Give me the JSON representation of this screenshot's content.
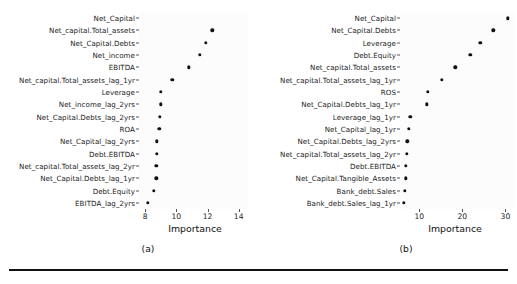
{
  "figure": {
    "caption_a": "(a)",
    "caption_b": "(b)"
  },
  "chart_data": [
    {
      "type": "scatter",
      "panel": "a",
      "title": "",
      "xlabel": "Importance",
      "ylabel": "",
      "xlim": [
        7.6,
        14.6
      ],
      "xticks": [
        8,
        10,
        12,
        14
      ],
      "xticklabels": [
        "8",
        "10",
        "12",
        "14"
      ],
      "grid": false,
      "legend": null,
      "categories": [
        "Net_Capital",
        "Net_capital.Total_assets",
        "Net_Capital.Debts",
        "Net_income",
        "EBITDA",
        "Net_capital.Total_assets_lag_1yr",
        "Leverage",
        "Net_income_lag_2yrs",
        "Net_Capital.Debts_lag_2yrs",
        "ROA",
        "Net_Capital_lag_2yrs",
        "Debt.EBITDA",
        "Net_capital.Total_assets_lag_2yr",
        "Net_Capital.Debts_lag_1yr",
        "Debt.Equity",
        "EBITDA_lag_2yrs"
      ],
      "values": [
        null,
        12.3,
        11.9,
        11.5,
        10.8,
        9.75,
        9.0,
        9.0,
        8.95,
        8.9,
        8.75,
        8.75,
        8.7,
        8.7,
        8.55,
        8.15
      ]
    },
    {
      "type": "scatter",
      "panel": "b",
      "title": "",
      "xlabel": "Importance",
      "ylabel": "",
      "xlim": [
        5.5,
        32.0
      ],
      "xticks": [
        10,
        20,
        30
      ],
      "xticklabels": [
        "10",
        "20",
        "30"
      ],
      "grid": false,
      "legend": null,
      "categories": [
        "Net_Capital",
        "Net_Capital.Debts",
        "Leverage",
        "Debt.Equity",
        "Net_capital.Total_assets",
        "Net_capital.Total_assets_lag_1yr",
        "ROS",
        "Net_Capital.Debts_lag_1yr",
        "Leverage_lag_1yr",
        "Net_Capital_lag_1yr",
        "Net_Capital.Debts_lag_2yrs",
        "Net_capital.Total_assets_lag_2yr",
        "Debt.EBITDA",
        "Net_Capital.Tangible_Assets",
        "Bank_debt.Sales",
        "Bank_debt.Sales_lag_1yr"
      ],
      "values": [
        30.6,
        27.2,
        24.2,
        21.8,
        18.4,
        15.2,
        12.0,
        11.7,
        7.9,
        7.6,
        7.2,
        7.1,
        6.9,
        6.8,
        6.6,
        6.4
      ]
    }
  ]
}
